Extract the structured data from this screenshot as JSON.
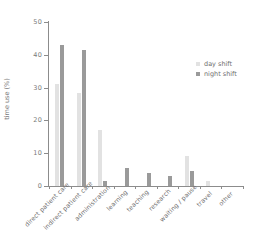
{
  "chart_data": {
    "type": "bar",
    "title": "",
    "xlabel": "",
    "ylabel": "time use (%)",
    "ylim": [
      0,
      50
    ],
    "yticks": [
      0,
      10,
      20,
      30,
      40,
      50
    ],
    "grid": false,
    "legend_position": "right",
    "categories": [
      "direct patient care",
      "indirect patient care",
      "administration",
      "learning",
      "teaching",
      "research",
      "waiting / pause",
      "travel",
      "other"
    ],
    "series": [
      {
        "name": "day shift",
        "color": "#e2e2e2",
        "values": [
          31,
          28.5,
          17,
          0,
          0,
          0,
          9,
          1.5,
          0
        ]
      },
      {
        "name": "night shift",
        "color": "#9a9a9a",
        "values": [
          43,
          41.5,
          1.5,
          5.5,
          4,
          3,
          4.7,
          0,
          0
        ]
      }
    ]
  },
  "legend": {
    "items": [
      {
        "label": "day shift",
        "swatch": "day"
      },
      {
        "label": "night shift",
        "swatch": "night"
      }
    ]
  },
  "axes": {
    "y_title": "time use (%)",
    "y_tick_labels": [
      "0",
      "10",
      "20",
      "30",
      "40",
      "50"
    ]
  },
  "colors": {
    "day_shift": "#e2e2e2",
    "night_shift": "#9a9a9a",
    "axis": "#8c8c8c",
    "text": "#6f6f6f",
    "background": "#ffffff"
  }
}
